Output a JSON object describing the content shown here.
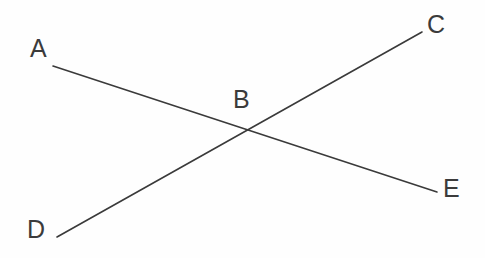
{
  "figure": {
    "background_color": "#fefefe",
    "width": 485,
    "height": 258
  },
  "style": {
    "line_color": "#3a3a3a",
    "line_width": 1.6,
    "label_color": "#3b3b3b",
    "label_font_size": 25
  },
  "chart_data": {
    "type": "scatter",
    "xlabel": "",
    "ylabel": "",
    "xlim": [
      0,
      485
    ],
    "ylim": [
      258,
      0
    ],
    "grid": false,
    "legend": "none",
    "points": [
      {
        "name": "A",
        "x": 53,
        "y": 66
      },
      {
        "name": "B",
        "x": 245,
        "y": 129
      },
      {
        "name": "C",
        "x": 422,
        "y": 32
      },
      {
        "name": "D",
        "x": 57,
        "y": 237
      },
      {
        "name": "E",
        "x": 437,
        "y": 192
      }
    ],
    "series": [
      {
        "name": "AE",
        "from": "A",
        "to": "E",
        "x": [
          53,
          437
        ],
        "y": [
          66,
          192
        ],
        "slope": 0.328
      },
      {
        "name": "DC",
        "from": "D",
        "to": "C",
        "x": [
          57,
          422
        ],
        "y": [
          237,
          32
        ],
        "slope": -0.562
      }
    ]
  },
  "lines": [
    {
      "id": "line-a-e",
      "x1": 53,
      "y1": 66,
      "x2": 437,
      "y2": 192
    },
    {
      "id": "line-d-c",
      "x1": 57,
      "y1": 237,
      "x2": 422,
      "y2": 32
    }
  ],
  "labels": {
    "a": {
      "text": "A",
      "left": 30,
      "top": 36
    },
    "b": {
      "text": "B",
      "left": 233,
      "top": 87
    },
    "c": {
      "text": "C",
      "left": 427,
      "top": 12
    },
    "d": {
      "text": "D",
      "left": 27,
      "top": 217
    },
    "e": {
      "text": "E",
      "left": 443,
      "top": 176
    }
  }
}
